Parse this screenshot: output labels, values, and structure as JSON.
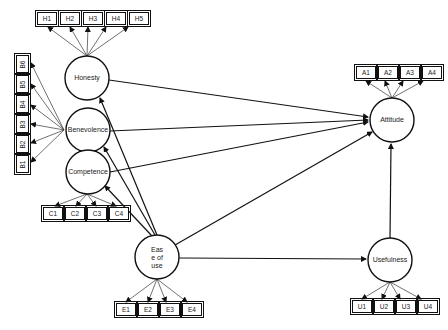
{
  "diagram": {
    "type": "structural-equation-model",
    "constructs": [
      {
        "id": "honesty",
        "label": "Honesty",
        "indicators": [
          "H1",
          "H2",
          "H3",
          "H4",
          "H5"
        ]
      },
      {
        "id": "benevolence",
        "label": "Benevolence",
        "indicators": [
          "B6",
          "B5",
          "B4",
          "B3",
          "B2",
          "B1"
        ]
      },
      {
        "id": "competence",
        "label": "Competence",
        "indicators": [
          "C1",
          "C2",
          "C3",
          "C4"
        ]
      },
      {
        "id": "ease",
        "label_lines": [
          "Eas",
          "e of",
          "use"
        ],
        "indicators": [
          "E1",
          "E2",
          "E3",
          "E4"
        ]
      },
      {
        "id": "attitude",
        "label": "Attitude",
        "indicators": [
          "A1",
          "A2",
          "A3",
          "A4"
        ]
      },
      {
        "id": "usefulness",
        "label": "Usefulness",
        "indicators": [
          "U1",
          "U2",
          "U3",
          "U4"
        ]
      }
    ],
    "paths": [
      {
        "from": "honesty",
        "to": "attitude"
      },
      {
        "from": "benevolence",
        "to": "attitude"
      },
      {
        "from": "competence",
        "to": "attitude"
      },
      {
        "from": "ease",
        "to": "attitude"
      },
      {
        "from": "ease",
        "to": "honesty"
      },
      {
        "from": "ease",
        "to": "benevolence"
      },
      {
        "from": "ease",
        "to": "competence"
      },
      {
        "from": "ease",
        "to": "usefulness"
      },
      {
        "from": "usefulness",
        "to": "attitude"
      }
    ]
  }
}
